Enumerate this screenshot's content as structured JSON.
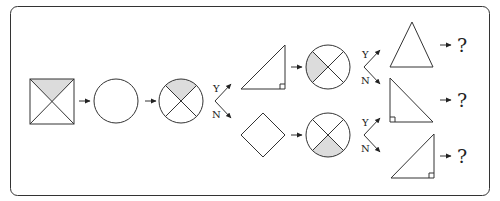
{
  "diagram": {
    "type": "flowchart",
    "colors": {
      "stroke": "#333333",
      "shade": "#dcdcdc",
      "background": "#ffffff"
    },
    "nodes": [
      {
        "id": "start-square",
        "shape": "square-with-diagonals",
        "shaded": "top"
      },
      {
        "id": "circle-empty",
        "shape": "circle"
      },
      {
        "id": "circle-x-top",
        "shape": "circle-with-x",
        "shaded": "top"
      },
      {
        "id": "right-triangle-br",
        "shape": "right-triangle",
        "right_angle": "bottom-right"
      },
      {
        "id": "diamond",
        "shape": "diamond"
      },
      {
        "id": "circle-x-left",
        "shape": "circle-with-x",
        "shaded": "left"
      },
      {
        "id": "circle-x-bottom",
        "shape": "circle-with-x",
        "shaded": "bottom"
      },
      {
        "id": "isosceles-triangle",
        "shape": "triangle"
      },
      {
        "id": "right-triangle-bl",
        "shape": "right-triangle",
        "right_angle": "bottom-left"
      },
      {
        "id": "right-triangle-br-2",
        "shape": "right-triangle",
        "right_angle": "bottom-right"
      }
    ],
    "branch_labels": {
      "yes": "Y",
      "no": "N"
    },
    "unknown_label": "?",
    "outputs": [
      {
        "from": "isosceles-triangle",
        "label": "?"
      },
      {
        "from": "right-triangle-bl",
        "label": "?"
      },
      {
        "from": "right-triangle-br-2",
        "label": "?"
      }
    ]
  }
}
